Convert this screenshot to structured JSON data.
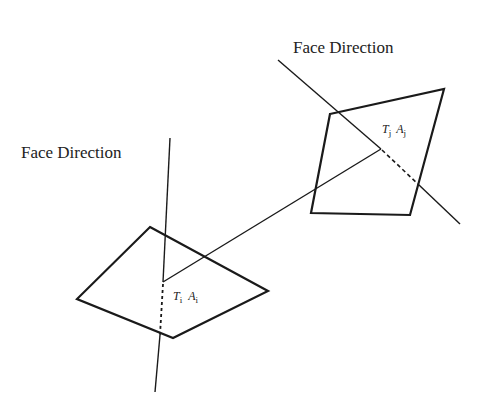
{
  "diagram": {
    "labels": {
      "face_direction_left": "Face Direction",
      "face_direction_right": "Face Direction",
      "face_i": {
        "T": "T",
        "T_sub": "i",
        "A": "A",
        "A_sub": "i"
      },
      "face_j": {
        "T": "T",
        "T_sub": "j",
        "A": "A",
        "A_sub": "j"
      }
    },
    "colors": {
      "stroke": "#1a1a1a",
      "background": "#ffffff",
      "text": "#222222"
    },
    "faces": [
      {
        "id": "face-i",
        "vertices": [
          [
            150,
            227
          ],
          [
            268,
            291
          ],
          [
            173,
            338
          ],
          [
            77,
            299
          ]
        ],
        "center": [
          163,
          282
        ]
      },
      {
        "id": "face-j",
        "vertices": [
          [
            330,
            114
          ],
          [
            444,
            89
          ],
          [
            410,
            215
          ],
          [
            311,
            213
          ]
        ],
        "center": [
          381,
          149
        ]
      }
    ],
    "normals": [
      {
        "id": "normal-i",
        "solid_top": [
          [
            170,
            138
          ],
          [
            163,
            282
          ]
        ],
        "dashed": [
          [
            163,
            282
          ],
          [
            160,
            335
          ]
        ],
        "solid_bottom": [
          [
            160,
            335
          ],
          [
            155,
            392
          ]
        ]
      },
      {
        "id": "normal-j",
        "solid_top": [
          [
            278,
            60
          ],
          [
            381,
            149
          ]
        ],
        "dashed": [
          [
            381,
            149
          ],
          [
            419,
            185
          ]
        ],
        "solid_bottom": [
          [
            419,
            185
          ],
          [
            460,
            224
          ]
        ]
      }
    ],
    "connector": [
      [
        163,
        282
      ],
      [
        381,
        149
      ]
    ]
  }
}
